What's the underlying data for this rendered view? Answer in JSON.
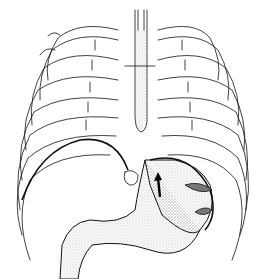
{
  "image": {
    "subject": "anatomical line drawing",
    "depicts": [
      "rib cage",
      "esophagus",
      "stomach",
      "diaphragm",
      "duodenum",
      "arrow"
    ],
    "colors": {
      "line": "#111111",
      "background": "#ffffff",
      "stipple": "#888888"
    }
  }
}
